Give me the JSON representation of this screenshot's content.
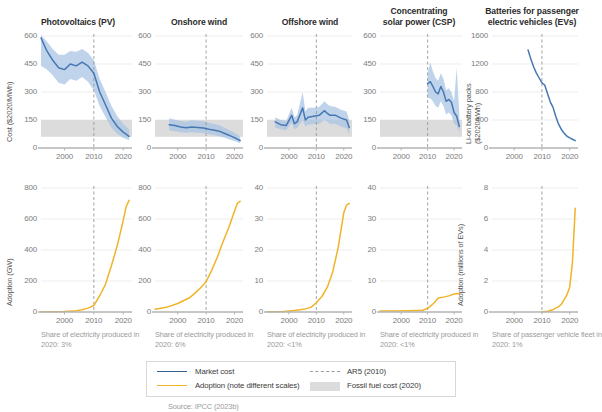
{
  "figure": {
    "source_note": "Source: IPCC (2023b)",
    "colors": {
      "market_cost": "#4878b4",
      "band": "#a9c4e4",
      "adoption": "#f0b429",
      "fossil_band": "#dcdcdc",
      "ar5_line": "#9a9a9a",
      "axis": "#b3b3b3",
      "grid": "#e9e9e9"
    }
  },
  "legend": {
    "items": [
      {
        "label": "Market cost",
        "type": "line",
        "color": "#34628f"
      },
      {
        "label": "Adoption (note different scales)",
        "type": "line",
        "color": "#f0b429"
      },
      {
        "label": "AR5 (2010)",
        "type": "dashed",
        "color": "#9a9a9a"
      },
      {
        "label": "Fossil fuel cost (2020)",
        "type": "swatch",
        "color": "#dcdcdc"
      }
    ]
  },
  "chart_data": [
    {
      "type": "line",
      "id": "pv-cost",
      "title": "Photovoltaics (PV)",
      "ylabel": "Cost ($2020/MWh)",
      "xlabel": "",
      "ylim": [
        0,
        600
      ],
      "xlim": [
        1992,
        2023
      ],
      "yticks": [
        0,
        150,
        300,
        450,
        600
      ],
      "xticks": [
        2000,
        2010,
        2020
      ],
      "ar5_year": 2010,
      "fossil_band": [
        60,
        150
      ],
      "grid": true,
      "series": [
        {
          "name": "Market cost",
          "x": [
            1992,
            1994,
            1996,
            1998,
            2000,
            2002,
            2004,
            2006,
            2008,
            2010,
            2012,
            2014,
            2016,
            2018,
            2020,
            2022
          ],
          "values": [
            590,
            520,
            470,
            430,
            420,
            450,
            440,
            460,
            440,
            400,
            300,
            230,
            160,
            115,
            85,
            62
          ]
        },
        {
          "name": "Upper bound",
          "x": [
            1992,
            1994,
            1996,
            1998,
            2000,
            2002,
            2004,
            2006,
            2008,
            2010,
            2012,
            2014,
            2016,
            2018,
            2020,
            2022
          ],
          "values": [
            605,
            570,
            530,
            500,
            500,
            520,
            515,
            530,
            510,
            470,
            370,
            300,
            225,
            170,
            130,
            100
          ]
        },
        {
          "name": "Lower bound",
          "x": [
            1992,
            1994,
            1996,
            1998,
            2000,
            2002,
            2004,
            2006,
            2008,
            2010,
            2012,
            2014,
            2016,
            2018,
            2020,
            2022
          ],
          "values": [
            440,
            420,
            390,
            350,
            340,
            370,
            360,
            380,
            355,
            310,
            225,
            165,
            110,
            75,
            55,
            42
          ]
        }
      ]
    },
    {
      "type": "line",
      "id": "onshore-cost",
      "title": "Onshore wind",
      "ylabel": "",
      "ylim": [
        0,
        600
      ],
      "xlim": [
        1992,
        2023
      ],
      "yticks": [
        0,
        150,
        300,
        450,
        600
      ],
      "xticks": [
        2000,
        2010,
        2020
      ],
      "ar5_year": 2010,
      "fossil_band": [
        60,
        150
      ],
      "grid": true,
      "series": [
        {
          "name": "Market cost",
          "x": [
            1997,
            1999,
            2001,
            2003,
            2005,
            2007,
            2009,
            2011,
            2013,
            2015,
            2017,
            2019,
            2021,
            2022
          ],
          "values": [
            125,
            120,
            112,
            108,
            112,
            110,
            107,
            100,
            95,
            88,
            75,
            62,
            48,
            40
          ]
        },
        {
          "name": "Upper bound",
          "x": [
            1997,
            1999,
            2001,
            2003,
            2005,
            2007,
            2009,
            2011,
            2013,
            2015,
            2017,
            2019,
            2021,
            2022
          ],
          "values": [
            160,
            152,
            145,
            140,
            148,
            146,
            143,
            135,
            128,
            120,
            105,
            90,
            72,
            62
          ]
        },
        {
          "name": "Lower bound",
          "x": [
            1997,
            1999,
            2001,
            2003,
            2005,
            2007,
            2009,
            2011,
            2013,
            2015,
            2017,
            2019,
            2021,
            2022
          ],
          "values": [
            95,
            90,
            85,
            82,
            84,
            82,
            80,
            74,
            68,
            62,
            52,
            42,
            32,
            26
          ]
        }
      ]
    },
    {
      "type": "line",
      "id": "offshore-cost",
      "title": "Offshore wind",
      "ylabel": "",
      "ylim": [
        0,
        600
      ],
      "xlim": [
        1992,
        2023
      ],
      "yticks": [
        0,
        150,
        300,
        450,
        600
      ],
      "xticks": [
        2000,
        2010,
        2020
      ],
      "ar5_year": 2010,
      "fossil_band": [
        60,
        150
      ],
      "grid": true,
      "series": [
        {
          "name": "Market cost",
          "x": [
            1995,
            1997,
            1999,
            2001,
            2002,
            2003,
            2005,
            2006,
            2007,
            2009,
            2011,
            2013,
            2014,
            2015,
            2017,
            2019,
            2021,
            2022
          ],
          "values": [
            140,
            125,
            120,
            175,
            130,
            140,
            215,
            150,
            165,
            170,
            175,
            200,
            185,
            175,
            175,
            160,
            150,
            110
          ]
        },
        {
          "name": "Upper bound",
          "x": [
            1995,
            1997,
            1999,
            2001,
            2002,
            2003,
            2005,
            2006,
            2007,
            2009,
            2011,
            2013,
            2014,
            2015,
            2017,
            2019,
            2021,
            2022
          ],
          "values": [
            165,
            150,
            145,
            215,
            165,
            175,
            300,
            195,
            215,
            215,
            220,
            250,
            235,
            225,
            220,
            205,
            195,
            150
          ]
        },
        {
          "name": "Lower bound",
          "x": [
            1995,
            1997,
            1999,
            2001,
            2002,
            2003,
            2005,
            2006,
            2007,
            2009,
            2011,
            2013,
            2014,
            2015,
            2017,
            2019,
            2021,
            2022
          ],
          "values": [
            110,
            100,
            95,
            135,
            100,
            108,
            150,
            115,
            125,
            128,
            130,
            150,
            140,
            130,
            128,
            115,
            105,
            75
          ]
        }
      ]
    },
    {
      "type": "line",
      "id": "csp-cost",
      "title": "Concentrating solar power (CSP)",
      "ylabel": "",
      "ylim": [
        0,
        600
      ],
      "xlim": [
        1992,
        2023
      ],
      "yticks": [
        0,
        150,
        300,
        450,
        600
      ],
      "xticks": [
        2000,
        2010,
        2020
      ],
      "ar5_year": 2010,
      "fossil_band": [
        60,
        150
      ],
      "grid": true,
      "series": [
        {
          "name": "Market cost",
          "x": [
            2010,
            2011,
            2012,
            2013,
            2014,
            2015,
            2016,
            2017,
            2018,
            2019,
            2020,
            2021,
            2022
          ],
          "values": [
            345,
            355,
            330,
            300,
            290,
            330,
            300,
            250,
            260,
            245,
            190,
            170,
            115
          ]
        },
        {
          "name": "Upper bound",
          "x": [
            2010,
            2011,
            2012,
            2013,
            2014,
            2015,
            2016,
            2017,
            2018,
            2019,
            2020,
            2021,
            2022
          ],
          "values": [
            400,
            460,
            410,
            375,
            360,
            400,
            370,
            310,
            320,
            300,
            250,
            430,
            175
          ]
        },
        {
          "name": "Lower bound",
          "x": [
            2010,
            2011,
            2012,
            2013,
            2014,
            2015,
            2016,
            2017,
            2018,
            2019,
            2020,
            2021,
            2022
          ],
          "values": [
            270,
            265,
            250,
            225,
            215,
            250,
            225,
            180,
            190,
            175,
            130,
            120,
            80
          ]
        }
      ]
    },
    {
      "type": "line",
      "id": "ev-cost",
      "title": "Batteries for passenger electric vehicles (EVs)",
      "ylabel": "Li-on battery packs ($2020/kWh)",
      "ylim": [
        0,
        1600
      ],
      "xlim": [
        1992,
        2023
      ],
      "yticks": [
        0,
        400,
        800,
        1200,
        1600
      ],
      "xticks": [
        2000,
        2010,
        2020
      ],
      "ar5_year": 2010,
      "grid": true,
      "series": [
        {
          "name": "Market cost",
          "x": [
            2005,
            2006,
            2007,
            2008,
            2009,
            2010,
            2011,
            2012,
            2013,
            2014,
            2015,
            2016,
            2017,
            2018,
            2019,
            2020,
            2021,
            2022
          ],
          "values": [
            1400,
            1270,
            1160,
            1070,
            1000,
            930,
            900,
            780,
            660,
            580,
            450,
            340,
            265,
            210,
            170,
            145,
            125,
            105
          ]
        }
      ]
    },
    {
      "type": "line",
      "id": "pv-adoption",
      "title": "",
      "ylabel": "Adoption (GW)",
      "ylim": [
        0,
        800
      ],
      "xlim": [
        1992,
        2023
      ],
      "yticks": [
        0,
        200,
        400,
        600,
        800
      ],
      "xticks": [
        2000,
        2010,
        2020
      ],
      "ar5_year": 2010,
      "grid": true,
      "footnote": "Share of electricity produced in 2020: 3%",
      "series": [
        {
          "name": "Adoption",
          "x": [
            1992,
            1996,
            2000,
            2004,
            2006,
            2008,
            2010,
            2012,
            2014,
            2016,
            2018,
            2020,
            2021,
            2022
          ],
          "values": [
            1,
            2,
            4,
            8,
            14,
            25,
            42,
            105,
            180,
            300,
            430,
            590,
            680,
            720
          ]
        }
      ]
    },
    {
      "type": "line",
      "id": "onshore-adoption",
      "title": "",
      "ylabel": "",
      "ylim": [
        0,
        800
      ],
      "xlim": [
        1992,
        2023
      ],
      "yticks": [
        0,
        200,
        400,
        600,
        800
      ],
      "xticks": [
        2000,
        2010,
        2020
      ],
      "ar5_year": 2010,
      "grid": true,
      "footnote": "Share of electricity produced in 2020: 6%",
      "series": [
        {
          "name": "Adoption",
          "x": [
            1992,
            1996,
            2000,
            2004,
            2006,
            2008,
            2010,
            2012,
            2014,
            2016,
            2018,
            2020,
            2021,
            2022
          ],
          "values": [
            18,
            30,
            55,
            90,
            120,
            155,
            195,
            270,
            355,
            455,
            545,
            650,
            700,
            715
          ]
        }
      ]
    },
    {
      "type": "line",
      "id": "offshore-adoption",
      "title": "",
      "ylabel": "",
      "ylim": [
        0,
        40
      ],
      "xlim": [
        1992,
        2023
      ],
      "yticks": [
        0,
        10,
        20,
        30,
        40
      ],
      "xticks": [
        2000,
        2010,
        2020
      ],
      "ar5_year": 2010,
      "grid": true,
      "footnote": "Share of electricity produced in 2020: <1%",
      "series": [
        {
          "name": "Adoption",
          "x": [
            1992,
            1998,
            2002,
            2006,
            2008,
            2010,
            2012,
            2014,
            2016,
            2018,
            2020,
            2021,
            2022
          ],
          "values": [
            0.1,
            0.2,
            0.5,
            1.0,
            1.5,
            3.0,
            5.0,
            8.0,
            13.0,
            21.0,
            32.0,
            34.5,
            35.0
          ]
        }
      ]
    },
    {
      "type": "line",
      "id": "csp-adoption",
      "title": "",
      "ylabel": "",
      "ylim": [
        0,
        40
      ],
      "xlim": [
        1992,
        2023
      ],
      "yticks": [
        0,
        10,
        20,
        30,
        40
      ],
      "xticks": [
        2000,
        2010,
        2020
      ],
      "ar5_year": 2010,
      "grid": true,
      "footnote": "Share of electricity produced in 2020: <1%",
      "series": [
        {
          "name": "Adoption",
          "x": [
            1992,
            1998,
            2002,
            2006,
            2008,
            2010,
            2011,
            2012,
            2013,
            2014,
            2016,
            2018,
            2020,
            2022
          ],
          "values": [
            0.3,
            0.35,
            0.4,
            0.45,
            0.5,
            1.2,
            1.8,
            2.6,
            3.5,
            4.5,
            4.8,
            5.2,
            5.8,
            6.0
          ]
        }
      ]
    },
    {
      "type": "line",
      "id": "ev-adoption",
      "title": "",
      "ylabel": "Adoption (millions of EVs)",
      "ylim": [
        0,
        8
      ],
      "xlim": [
        1992,
        2023
      ],
      "yticks": [
        0,
        2,
        4,
        6,
        8
      ],
      "xticks": [
        2000,
        2010,
        2020
      ],
      "ar5_year": 2010,
      "grid": true,
      "footnote": "Share of passenger vehicle fleet in 2020: 1%",
      "series": [
        {
          "name": "Adoption",
          "x": [
            2010,
            2012,
            2014,
            2016,
            2017,
            2018,
            2019,
            2020,
            2021,
            2022
          ],
          "values": [
            0.01,
            0.05,
            0.15,
            0.35,
            0.5,
            0.8,
            1.1,
            1.6,
            3.2,
            6.7
          ]
        }
      ]
    }
  ]
}
